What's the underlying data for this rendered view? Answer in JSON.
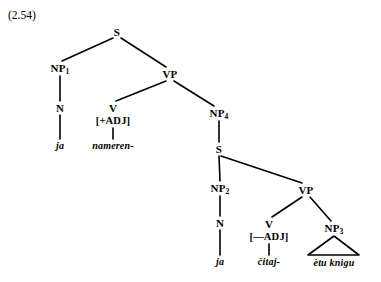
{
  "figure": {
    "example_number": "(2.54)",
    "width": 381,
    "height": 282,
    "background_color": "#ffffff",
    "line_color": "#000000",
    "text_color": "#000000"
  },
  "tree": {
    "root_label": "S",
    "nodes": {
      "s_top": {
        "label": "S",
        "x": 117,
        "y": 32
      },
      "np1": {
        "label": "NP",
        "sub": "1",
        "x": 60,
        "y": 68
      },
      "n1": {
        "label": "N",
        "x": 60,
        "y": 108
      },
      "ja1": {
        "label": "ja",
        "x": 60,
        "y": 146
      },
      "vp1": {
        "label": "VP",
        "x": 170,
        "y": 74
      },
      "v1": {
        "label": "V",
        "x": 113,
        "y": 108
      },
      "v1_feature": {
        "label": "[+ADJ]",
        "x": 113,
        "y": 121
      },
      "nameren": {
        "label": "nameren-",
        "x": 113,
        "y": 146
      },
      "np4": {
        "label": "NP",
        "sub": "4",
        "x": 219,
        "y": 113
      },
      "s_embedded": {
        "label": "S",
        "x": 219,
        "y": 149
      },
      "np2": {
        "label": "NP",
        "sub": "2",
        "x": 220,
        "y": 188
      },
      "n2": {
        "label": "N",
        "x": 220,
        "y": 223
      },
      "ja2": {
        "label": "ja",
        "x": 220,
        "y": 262
      },
      "vp2": {
        "label": "VP",
        "x": 306,
        "y": 190
      },
      "v2": {
        "label": "V",
        "x": 269,
        "y": 224
      },
      "v2_feature": {
        "label": "[—ADJ]",
        "x": 269,
        "y": 237
      },
      "citaj": {
        "label": "čitaj-",
        "x": 269,
        "y": 262
      },
      "np3": {
        "label": "NP",
        "sub": "3",
        "x": 334,
        "y": 228
      },
      "etu_knigu": {
        "label": "ètu knigu",
        "x": 334,
        "y": 263
      }
    },
    "edges": [
      {
        "from": "s_top",
        "to": "np1",
        "x1": 113,
        "y1": 38,
        "x2": 62,
        "y2": 61
      },
      {
        "from": "s_top",
        "to": "vp1",
        "x1": 121,
        "y1": 38,
        "x2": 166,
        "y2": 67
      },
      {
        "from": "np1",
        "to": "n1",
        "x1": 60,
        "y1": 76,
        "x2": 60,
        "y2": 101
      },
      {
        "from": "n1",
        "to": "ja1",
        "x1": 60,
        "y1": 115,
        "x2": 60,
        "y2": 139
      },
      {
        "from": "vp1",
        "to": "v1",
        "x1": 166,
        "y1": 81,
        "x2": 116,
        "y2": 101
      },
      {
        "from": "vp1",
        "to": "np4",
        "x1": 174,
        "y1": 81,
        "x2": 214,
        "y2": 106
      },
      {
        "from": "v1_feature",
        "to": "nameren",
        "x1": 113,
        "y1": 128,
        "x2": 113,
        "y2": 139
      },
      {
        "from": "np4",
        "to": "s_embedded",
        "x1": 219,
        "y1": 121,
        "x2": 219,
        "y2": 142
      },
      {
        "from": "s_embedded",
        "to": "np2",
        "x1": 219,
        "y1": 156,
        "x2": 220,
        "y2": 181
      },
      {
        "from": "s_embedded",
        "to": "vp2",
        "x1": 221,
        "y1": 156,
        "x2": 302,
        "y2": 183
      },
      {
        "from": "np2",
        "to": "n2",
        "x1": 220,
        "y1": 196,
        "x2": 220,
        "y2": 216
      },
      {
        "from": "n2",
        "to": "ja2",
        "x1": 220,
        "y1": 230,
        "x2": 220,
        "y2": 255
      },
      {
        "from": "vp2",
        "to": "v2",
        "x1": 302,
        "y1": 197,
        "x2": 272,
        "y2": 217
      },
      {
        "from": "vp2",
        "to": "np3",
        "x1": 310,
        "y1": 197,
        "x2": 331,
        "y2": 221
      },
      {
        "from": "v2_feature",
        "to": "citaj",
        "x1": 269,
        "y1": 244,
        "x2": 269,
        "y2": 255
      }
    ],
    "triangle": {
      "node": "np3",
      "apex_x": 334,
      "apex_y": 236,
      "left_x": 308,
      "right_x": 359,
      "base_y": 255
    }
  }
}
